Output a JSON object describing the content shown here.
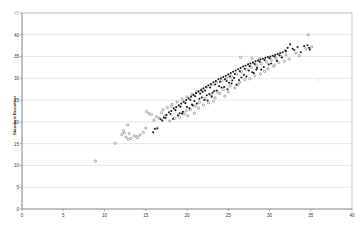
{
  "chart_data": {
    "type": "scatter",
    "title": "",
    "xlabel": "",
    "ylabel": "Standard Deviation",
    "xlim": [
      0,
      40
    ],
    "ylim": [
      0,
      45
    ],
    "xticks": [
      0,
      5,
      10,
      15,
      20,
      25,
      30,
      35,
      40
    ],
    "yticks": [
      0,
      5,
      10,
      15,
      20,
      25,
      30,
      35,
      40,
      45
    ],
    "grid": "horizontal",
    "legend": "none",
    "colors": {
      "series_filled": "#1f1f1f",
      "series_hollow": "#8c8c8c",
      "gridline": "#d9d9d9",
      "axis": "#808080",
      "text": "#333333"
    },
    "series": [
      {
        "name": "filled",
        "marker": "filled-circle",
        "points": [
          [
            16.1,
            18.4
          ],
          [
            16.4,
            18.5
          ],
          [
            15.9,
            17.6
          ],
          [
            16.8,
            20.6
          ],
          [
            17.2,
            21.0
          ],
          [
            17.0,
            20.3
          ],
          [
            17.5,
            21.6
          ],
          [
            17.8,
            22.2
          ],
          [
            17.4,
            20.9
          ],
          [
            18.1,
            22.5
          ],
          [
            18.4,
            23.1
          ],
          [
            18.0,
            21.8
          ],
          [
            18.7,
            23.4
          ],
          [
            19.0,
            23.8
          ],
          [
            18.6,
            22.7
          ],
          [
            19.3,
            24.2
          ],
          [
            19.6,
            24.6
          ],
          [
            19.2,
            23.5
          ],
          [
            19.9,
            25.0
          ],
          [
            20.2,
            25.4
          ],
          [
            19.8,
            24.3
          ],
          [
            20.5,
            25.8
          ],
          [
            20.8,
            26.2
          ],
          [
            20.4,
            25.1
          ],
          [
            21.1,
            26.6
          ],
          [
            21.4,
            27.0
          ],
          [
            21.0,
            25.9
          ],
          [
            21.7,
            27.3
          ],
          [
            22.0,
            27.7
          ],
          [
            21.6,
            26.5
          ],
          [
            22.3,
            28.0
          ],
          [
            22.6,
            28.4
          ],
          [
            22.2,
            27.2
          ],
          [
            22.9,
            28.7
          ],
          [
            23.2,
            29.1
          ],
          [
            22.8,
            27.9
          ],
          [
            23.5,
            29.4
          ],
          [
            23.8,
            29.8
          ],
          [
            23.4,
            28.6
          ],
          [
            24.1,
            30.0
          ],
          [
            24.4,
            30.3
          ],
          [
            24.0,
            29.2
          ],
          [
            24.7,
            30.6
          ],
          [
            25.0,
            30.9
          ],
          [
            24.6,
            29.8
          ],
          [
            25.3,
            31.2
          ],
          [
            25.6,
            31.5
          ],
          [
            25.2,
            30.4
          ],
          [
            25.9,
            31.8
          ],
          [
            26.2,
            32.1
          ],
          [
            25.8,
            31.0
          ],
          [
            26.5,
            32.4
          ],
          [
            26.8,
            32.7
          ],
          [
            26.4,
            31.6
          ],
          [
            27.1,
            32.9
          ],
          [
            27.4,
            33.2
          ],
          [
            27.0,
            32.2
          ],
          [
            27.7,
            33.4
          ],
          [
            28.0,
            33.6
          ],
          [
            27.6,
            32.8
          ],
          [
            28.3,
            33.9
          ],
          [
            28.6,
            34.1
          ],
          [
            28.2,
            33.3
          ],
          [
            28.9,
            34.3
          ],
          [
            29.2,
            34.5
          ],
          [
            28.8,
            33.8
          ],
          [
            29.5,
            34.7
          ],
          [
            29.8,
            34.9
          ],
          [
            29.4,
            34.2
          ],
          [
            30.1,
            35.0
          ],
          [
            30.4,
            35.2
          ],
          [
            30.0,
            34.6
          ],
          [
            30.7,
            35.4
          ],
          [
            31.0,
            35.6
          ],
          [
            30.6,
            35.0
          ],
          [
            31.3,
            35.8
          ],
          [
            31.6,
            36.0
          ],
          [
            31.2,
            35.3
          ],
          [
            31.9,
            36.4
          ],
          [
            32.2,
            37.0
          ],
          [
            32.5,
            37.8
          ],
          [
            32.0,
            36.2
          ],
          [
            33.0,
            36.5
          ],
          [
            33.4,
            37.2
          ],
          [
            34.2,
            37.4
          ],
          [
            34.6,
            37.6
          ],
          [
            34.8,
            37.0
          ],
          [
            34.9,
            36.6
          ],
          [
            33.8,
            36.0
          ],
          [
            20.3,
            23.1
          ],
          [
            21.2,
            24.2
          ],
          [
            22.1,
            25.0
          ],
          [
            23.0,
            25.8
          ],
          [
            19.5,
            22.3
          ],
          [
            18.9,
            21.5
          ],
          [
            20.9,
            24.8
          ],
          [
            21.8,
            25.6
          ],
          [
            22.7,
            26.4
          ],
          [
            23.6,
            27.2
          ],
          [
            24.5,
            28.0
          ],
          [
            25.4,
            28.8
          ],
          [
            26.3,
            29.6
          ],
          [
            27.2,
            30.4
          ],
          [
            28.1,
            31.2
          ],
          [
            29.0,
            32.0
          ],
          [
            24.9,
            27.5
          ],
          [
            26.0,
            28.5
          ],
          [
            21.5,
            25.3
          ],
          [
            22.4,
            26.1
          ],
          [
            23.3,
            27.1
          ],
          [
            24.2,
            27.9
          ],
          [
            25.1,
            29.0
          ],
          [
            26.6,
            30.2
          ],
          [
            27.9,
            31.4
          ],
          [
            29.3,
            32.6
          ],
          [
            30.2,
            33.4
          ],
          [
            19.1,
            22.0
          ],
          [
            20.0,
            23.4
          ],
          [
            20.6,
            24.0
          ],
          [
            23.9,
            28.2
          ],
          [
            24.8,
            29.4
          ],
          [
            25.7,
            30.1
          ],
          [
            28.5,
            32.4
          ],
          [
            29.9,
            33.2
          ],
          [
            30.9,
            34.0
          ],
          [
            22.5,
            24.9
          ],
          [
            23.1,
            26.7
          ],
          [
            21.9,
            26.9
          ],
          [
            20.7,
            23.8
          ],
          [
            26.9,
            30.8
          ],
          [
            27.5,
            31.8
          ],
          [
            18.3,
            20.7
          ],
          [
            19.4,
            21.9
          ],
          [
            25.5,
            29.5
          ],
          [
            28.4,
            32.0
          ],
          [
            31.5,
            34.8
          ],
          [
            32.8,
            36.8
          ]
        ]
      },
      {
        "name": "hollow",
        "marker": "hollow-circle",
        "points": [
          [
            8.9,
            11.0
          ],
          [
            11.3,
            15.1
          ],
          [
            12.1,
            17.1
          ],
          [
            12.4,
            17.5
          ],
          [
            12.6,
            16.5
          ],
          [
            12.9,
            16.0
          ],
          [
            12.8,
            19.3
          ],
          [
            13.2,
            16.2
          ],
          [
            13.6,
            16.8
          ],
          [
            13.9,
            16.6
          ],
          [
            14.3,
            17.0
          ],
          [
            14.7,
            17.6
          ],
          [
            15.1,
            22.4
          ],
          [
            15.4,
            21.9
          ],
          [
            15.7,
            21.7
          ],
          [
            16.0,
            20.4
          ],
          [
            16.3,
            21.2
          ],
          [
            12.3,
            18.0
          ],
          [
            13.0,
            17.3
          ],
          [
            14.0,
            16.4
          ],
          [
            15.0,
            18.6
          ],
          [
            16.6,
            20.9
          ],
          [
            17.1,
            22.8
          ],
          [
            17.6,
            23.3
          ],
          [
            18.2,
            24.0
          ],
          [
            18.8,
            24.6
          ],
          [
            19.4,
            25.2
          ],
          [
            20.0,
            25.7
          ],
          [
            20.6,
            26.3
          ],
          [
            21.2,
            26.9
          ],
          [
            21.8,
            27.4
          ],
          [
            22.4,
            28.0
          ],
          [
            23.0,
            28.5
          ],
          [
            23.6,
            29.0
          ],
          [
            24.2,
            29.5
          ],
          [
            24.8,
            30.0
          ],
          [
            25.4,
            30.5
          ],
          [
            26.0,
            31.0
          ],
          [
            26.6,
            31.5
          ],
          [
            27.2,
            32.0
          ],
          [
            27.8,
            32.5
          ],
          [
            28.4,
            33.0
          ],
          [
            29.0,
            33.4
          ],
          [
            29.6,
            33.8
          ],
          [
            30.2,
            34.2
          ],
          [
            30.8,
            34.6
          ],
          [
            31.4,
            35.0
          ],
          [
            32.0,
            35.4
          ],
          [
            20.1,
            21.4
          ],
          [
            20.9,
            22.0
          ],
          [
            17.9,
            20.2
          ],
          [
            18.5,
            20.8
          ],
          [
            19.1,
            21.1
          ],
          [
            19.7,
            21.8
          ],
          [
            21.5,
            24.5
          ],
          [
            22.2,
            25.4
          ],
          [
            22.9,
            26.2
          ],
          [
            23.7,
            26.8
          ],
          [
            24.4,
            27.4
          ],
          [
            25.2,
            28.2
          ],
          [
            26.4,
            29.1
          ],
          [
            27.0,
            29.7
          ],
          [
            28.2,
            30.6
          ],
          [
            29.4,
            31.6
          ],
          [
            30.5,
            32.8
          ],
          [
            31.8,
            33.9
          ],
          [
            26.5,
            34.8
          ],
          [
            27.9,
            34.6
          ],
          [
            28.8,
            34.5
          ],
          [
            34.7,
            40.0
          ],
          [
            33.2,
            35.8
          ],
          [
            34.4,
            36.8
          ],
          [
            35.1,
            37.2
          ],
          [
            19.9,
            22.6
          ],
          [
            21.0,
            23.6
          ],
          [
            22.6,
            24.4
          ],
          [
            24.0,
            26.5
          ],
          [
            25.8,
            27.8
          ],
          [
            23.4,
            25.5
          ],
          [
            20.4,
            22.8
          ],
          [
            18.1,
            23.6
          ],
          [
            17.3,
            21.3
          ],
          [
            16.9,
            22.1
          ],
          [
            29.8,
            32.2
          ],
          [
            30.6,
            33.0
          ],
          [
            31.1,
            33.6
          ],
          [
            32.4,
            34.4
          ],
          [
            33.6,
            35.2
          ],
          [
            22.0,
            23.9
          ],
          [
            25.0,
            26.9
          ],
          [
            26.2,
            28.6
          ],
          [
            27.6,
            29.9
          ],
          [
            28.9,
            31.0
          ],
          [
            24.6,
            25.9
          ],
          [
            23.2,
            24.7
          ],
          [
            21.4,
            23.2
          ]
        ]
      }
    ]
  },
  "axes": {
    "y_title": "Standard Deviation",
    "x_tick_labels": [
      "0",
      "5",
      "10",
      "15",
      "20",
      "25",
      "30",
      "35",
      "40"
    ],
    "y_tick_labels": [
      "45",
      "40",
      "35",
      "30",
      "25",
      "20",
      "15",
      "10",
      "5",
      "0"
    ]
  }
}
